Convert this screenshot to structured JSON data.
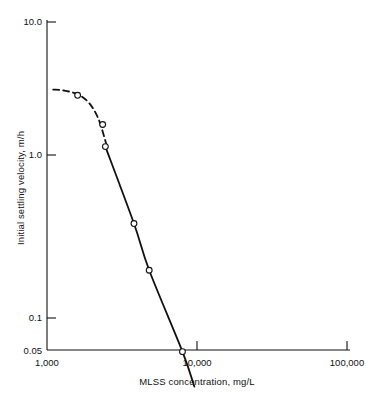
{
  "chart_data": {
    "type": "scatter",
    "title": "",
    "subtitle": "",
    "xlabel": "MLSS concentration, mg/L",
    "ylabel": "Initial settling velocity, m/h",
    "xscale": "log",
    "yscale": "log",
    "xlim": [
      1000,
      100000
    ],
    "ylim": [
      0.05,
      10.0
    ],
    "grid": false,
    "legend": null,
    "x_tick_labels": [
      "1,000",
      "10,000",
      "100,000"
    ],
    "x_tick_values": [
      1000,
      10000,
      100000
    ],
    "y_tick_labels": [
      "10.0",
      "1.0",
      "0.1",
      "0.05"
    ],
    "y_tick_values": [
      10.0,
      1.0,
      0.1,
      0.05
    ],
    "series": [
      {
        "name": "Measured data",
        "marker": "open-circle",
        "x": [
          1600,
          2350,
          2450,
          3800,
          4800,
          8000
        ],
        "y": [
          3.55,
          2.35,
          1.72,
          0.58,
          0.3,
          0.095
        ]
      }
    ],
    "fit_curve_dashed": {
      "name": "Extrapolated low-concentration region",
      "style": "dashed",
      "x": [
        1100,
        1300,
        1600,
        1900,
        2200,
        2500
      ],
      "y": [
        3.85,
        3.8,
        3.6,
        3.2,
        2.55,
        1.75
      ]
    },
    "fit_curve_solid": {
      "name": "Log-linear settling relationship",
      "style": "solid",
      "x": [
        2450,
        3800,
        4800,
        8000,
        9600
      ],
      "y": [
        1.72,
        0.58,
        0.3,
        0.095,
        0.058
      ]
    },
    "annotations": []
  },
  "axes": {
    "x_title": "MLSS concentration, mg/L",
    "y_title": "Initial settling velocity, m/h",
    "x_ticks": [
      {
        "label": "1,000",
        "value": 1000
      },
      {
        "label": "10,000",
        "value": 10000
      },
      {
        "label": "100,000",
        "value": 100000
      }
    ],
    "y_ticks": [
      {
        "label": "10.0",
        "value": 10.0
      },
      {
        "label": "1.0",
        "value": 1.0
      },
      {
        "label": "0.1",
        "value": 0.1
      },
      {
        "label": "0.05",
        "value": 0.05
      }
    ]
  },
  "style": {
    "axis_color": "#111111",
    "curve_color": "#111111",
    "marker_stroke": "#111111",
    "marker_fill": "#ffffff",
    "background": "#ffffff"
  }
}
